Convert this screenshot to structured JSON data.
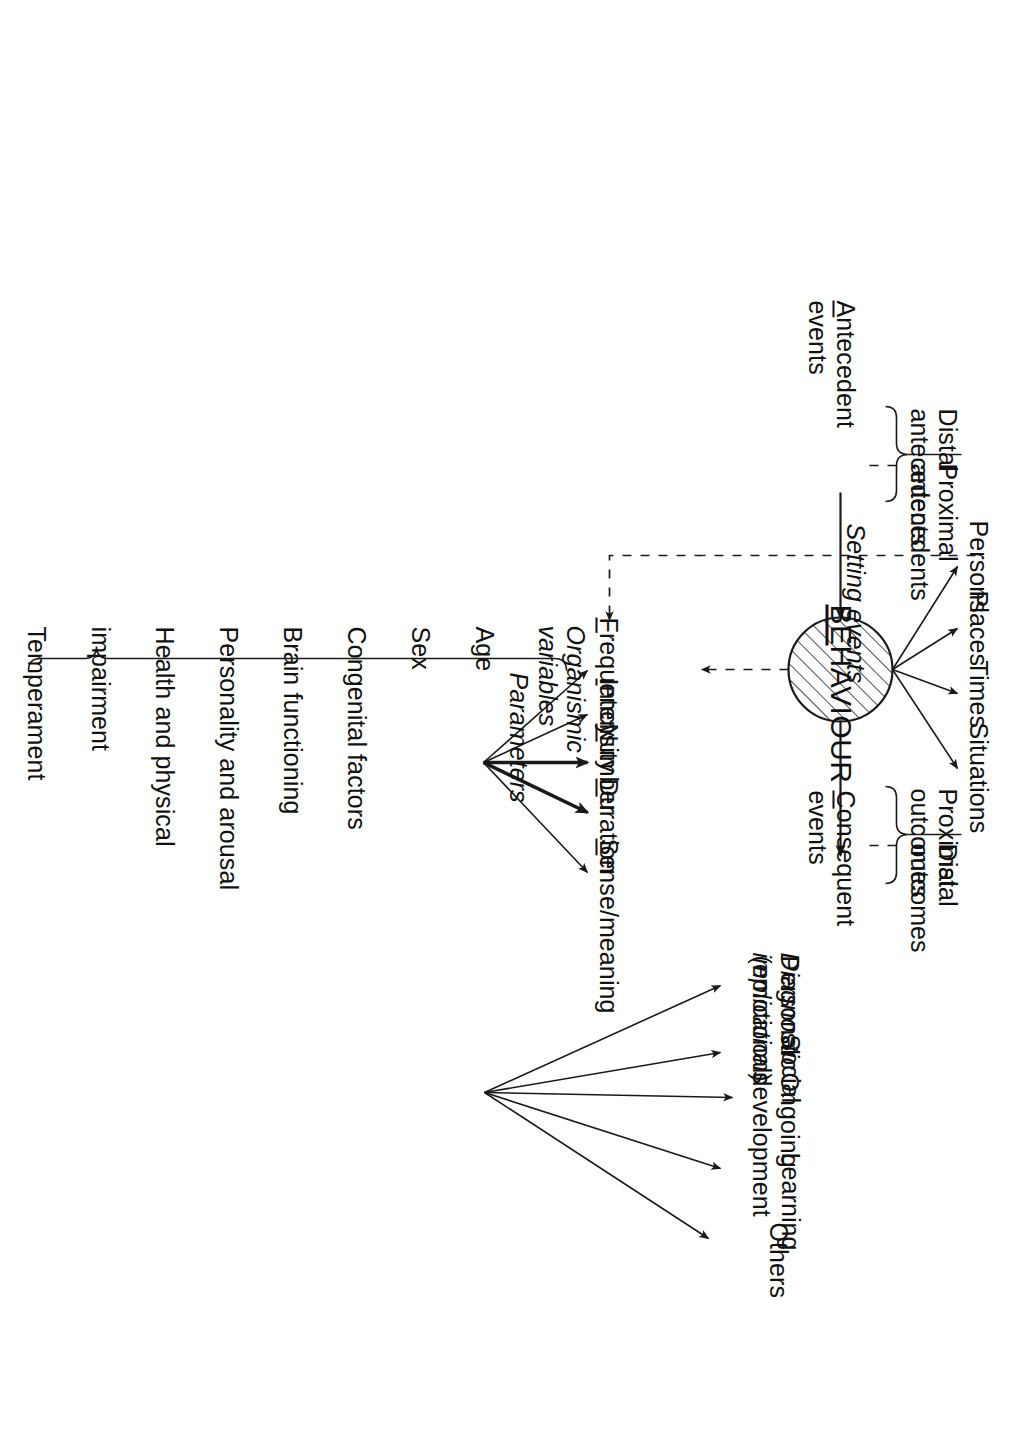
{
  "figure": {
    "orientation": "rotated-90",
    "ink_color": "#1a1a1a",
    "page_color": "#ffffff"
  },
  "antecedents": {
    "axis_label_line1": "Antecedent",
    "axis_label_line2": "events",
    "axis_label_underlined_letter": "A",
    "brace_group": [
      {
        "line1": "Distal",
        "line2": "antecedents"
      },
      {
        "line1": "Proximal",
        "line2": "antecedents"
      }
    ]
  },
  "setting_events": {
    "label": "Setting events",
    "items": [
      "Persons",
      "Places",
      "Times",
      "Situations"
    ]
  },
  "behaviour": {
    "label": "BEHAVIOUR",
    "underlined_prefix": "BE",
    "shape": "hatched-circle"
  },
  "parameters": {
    "label": "Parameters",
    "items": [
      {
        "text": "Frequency",
        "initial": "F",
        "emphasis": "normal"
      },
      {
        "text": "Intensity",
        "initial": "I",
        "emphasis": "normal"
      },
      {
        "text": "Number",
        "initial": "N",
        "emphasis": "bold"
      },
      {
        "text": "Duration",
        "initial": "D",
        "emphasis": "bold"
      },
      {
        "text": "Sense/meaning",
        "initial": "S",
        "emphasis": "normal"
      }
    ],
    "mnemonic": "FINDS"
  },
  "diagnostic": {
    "label_line1": "Diagnostic",
    "label_line2": "implications",
    "items": [
      {
        "line1": "Personal",
        "line2": "(emotional)"
      },
      {
        "line1": "Social",
        "line2": ""
      },
      {
        "line1": "Ongoing",
        "line2": "development"
      },
      {
        "line1": "Learning",
        "line2": ""
      },
      {
        "line1": "Others",
        "line2": ""
      }
    ]
  },
  "consequents": {
    "axis_label_line1": "Consequent",
    "axis_label_line2": "events",
    "axis_label_underlined_letter": "C",
    "brace_group": [
      {
        "line1": "Proximal",
        "line2": "outcomes"
      },
      {
        "line1": "Distal",
        "line2": "outcomes"
      }
    ]
  },
  "organismic": {
    "label_line1": "Organismic",
    "label_line2": "variables",
    "items": [
      "Age",
      "Sex",
      "Congenital factors",
      "Brain functioning",
      "Personality and arousal",
      "Health and physical",
      "impairment",
      "Temperament",
      "Autonomic reactivity",
      "Stress proneness",
      "Cognition — IQ",
      "Achievement level"
    ]
  }
}
